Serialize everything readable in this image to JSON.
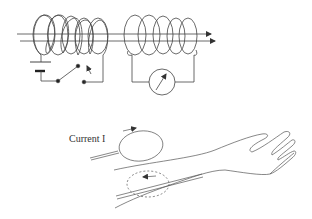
{
  "figure": {
    "top_panel": {
      "description": "Two coils wound on a shared core; primary with battery and switch, secondary with galvanometer",
      "primary_circuit": {
        "components": [
          "battery-icon",
          "switch-icon",
          "coil-icon"
        ]
      },
      "secondary_circuit": {
        "components": [
          "coil-icon",
          "galvanometer-icon"
        ]
      }
    },
    "bottom_panel": {
      "description": "Current loop near an arm inducing an opposite current loop in tissue",
      "current_label": "Current I"
    },
    "colors": {
      "stroke": "#333333",
      "background": "#ffffff"
    }
  }
}
